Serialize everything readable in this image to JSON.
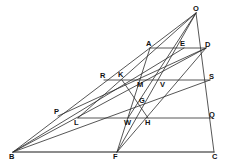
{
  "figure": {
    "type": "geometric-construction",
    "title": "",
    "width": 233,
    "height": 167,
    "background_color": "#ffffff",
    "line_color": "#2b2b2b",
    "label_color": "#111111"
  },
  "points": [
    {
      "id": "O",
      "label": "O",
      "x": 196,
      "y": 13,
      "label_x": 193,
      "label_y": 5
    },
    {
      "id": "A",
      "label": "A",
      "x": 150,
      "y": 48,
      "label_x": 146,
      "label_y": 40
    },
    {
      "id": "E",
      "label": "E",
      "x": 184,
      "y": 48,
      "label_x": 180,
      "label_y": 40
    },
    {
      "id": "D",
      "label": "D",
      "x": 206,
      "y": 48,
      "label_x": 205,
      "label_y": 41
    },
    {
      "id": "R",
      "label": "R",
      "x": 104,
      "y": 80,
      "label_x": 100,
      "label_y": 72
    },
    {
      "id": "K",
      "label": "K",
      "x": 122,
      "y": 80,
      "label_x": 118,
      "label_y": 71
    },
    {
      "id": "M",
      "label": "M",
      "x": 141,
      "y": 87,
      "label_x": 137,
      "label_y": 81
    },
    {
      "id": "V",
      "label": "V",
      "x": 163,
      "y": 87,
      "label_x": 160,
      "label_y": 81
    },
    {
      "id": "S",
      "label": "S",
      "x": 210,
      "y": 80,
      "label_x": 209,
      "label_y": 73
    },
    {
      "id": "G",
      "label": "G",
      "x": 142,
      "y": 104,
      "label_x": 139,
      "label_y": 97
    },
    {
      "id": "P",
      "label": "P",
      "x": 58,
      "y": 116,
      "label_x": 54,
      "label_y": 108
    },
    {
      "id": "L",
      "label": "L",
      "x": 78,
      "y": 118,
      "label_x": 74,
      "label_y": 119
    },
    {
      "id": "W",
      "label": "W",
      "x": 128,
      "y": 118,
      "label_x": 124,
      "label_y": 119
    },
    {
      "id": "H",
      "label": "H",
      "x": 148,
      "y": 118,
      "label_x": 145,
      "label_y": 119
    },
    {
      "id": "Q",
      "label": "Q",
      "x": 211,
      "y": 118,
      "label_x": 209,
      "label_y": 111
    },
    {
      "id": "B",
      "label": "B",
      "x": 13,
      "y": 152,
      "label_x": 9,
      "label_y": 153
    },
    {
      "id": "F",
      "label": "F",
      "x": 117,
      "y": 152,
      "label_x": 113,
      "label_y": 153
    },
    {
      "id": "C",
      "label": "C",
      "x": 214,
      "y": 152,
      "label_x": 212,
      "label_y": 153
    }
  ],
  "segments": [
    {
      "name": "base-BC",
      "from": "B",
      "to": "C",
      "weight": "heavy"
    },
    {
      "name": "side-BO",
      "from": "B",
      "to": "O",
      "weight": "normal"
    },
    {
      "name": "side-OC",
      "from": "O",
      "to": "C",
      "weight": "normal"
    },
    {
      "name": "ray-B-to-D",
      "from": "B",
      "to": "D",
      "weight": "normal"
    },
    {
      "name": "ray-B-to-E",
      "from": "B",
      "to": "E",
      "weight": "normal"
    },
    {
      "name": "ray-B-to-S",
      "from": "B",
      "to": "S",
      "weight": "normal"
    },
    {
      "name": "chord-AD",
      "from": "A",
      "to": "D",
      "weight": "normal"
    },
    {
      "name": "chord-RS",
      "from": "R",
      "to": "S",
      "weight": "normal"
    },
    {
      "name": "chord-LQ",
      "from": "L",
      "to": "Q",
      "weight": "normal"
    },
    {
      "name": "cevian-O-to-F",
      "from": "O",
      "to": "F",
      "weight": "normal"
    },
    {
      "name": "cevian-O-to-L",
      "from": "O",
      "to": "L",
      "weight": "normal"
    },
    {
      "name": "cevian-O-to-W",
      "from": "O",
      "to": "W",
      "weight": "normal"
    },
    {
      "name": "cevian-D-to-F",
      "from": "D",
      "to": "F",
      "weight": "normal"
    },
    {
      "name": "cevian-D-to-P",
      "from": "D",
      "to": "P",
      "weight": "normal"
    },
    {
      "name": "cevian-A-to-F",
      "from": "A",
      "to": "F",
      "weight": "normal"
    },
    {
      "name": "segment-K-to-H",
      "from": "K",
      "to": "H",
      "weight": "normal"
    }
  ]
}
